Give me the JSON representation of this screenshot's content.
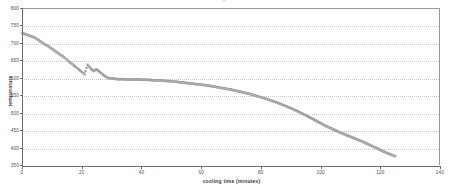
{
  "chart": {
    "title": "cooling curve",
    "plot_bg": "#ffffff",
    "grid_color": "#c9c9c9",
    "axis_color": "#6e6e6e",
    "marker_color": "#9e9e9e"
  },
  "chart_data": {
    "type": "scatter",
    "title": "cooling curve",
    "xlabel": "cooling time (minutes)",
    "ylabel": "temperature",
    "xlim": [
      0,
      140
    ],
    "ylim": [
      350,
      800
    ],
    "xticks": [
      0,
      20,
      40,
      60,
      80,
      100,
      120,
      140
    ],
    "yticks": [
      350,
      400,
      450,
      500,
      550,
      600,
      650,
      700,
      750,
      800
    ],
    "grid": true,
    "legend": false,
    "marker": "open-square",
    "series": [
      {
        "name": "cooling curve",
        "x": [
          0,
          1,
          2,
          3,
          4,
          5,
          6,
          7,
          8,
          9,
          10,
          11,
          12,
          13,
          14,
          15,
          16,
          17,
          18,
          19,
          20,
          21,
          22,
          23,
          24,
          25,
          26,
          27,
          28,
          29,
          30,
          31,
          32,
          33,
          34,
          36,
          38,
          40,
          42,
          44,
          46,
          48,
          50,
          52,
          54,
          56,
          58,
          60,
          62,
          64,
          66,
          68,
          70,
          72,
          74,
          76,
          78,
          80,
          82,
          84,
          86,
          88,
          90,
          92,
          94,
          96,
          98,
          100,
          102,
          104,
          106,
          108,
          110,
          112,
          114,
          116,
          118,
          120,
          122,
          124,
          125
        ],
        "y": [
          731,
          728,
          725,
          722,
          719,
          714,
          708,
          702,
          697,
          692,
          686,
          680,
          674,
          668,
          662,
          655,
          648,
          641,
          634,
          627,
          620,
          613,
          640,
          630,
          622,
          627,
          620,
          613,
          606,
          602,
          601,
          600,
          599,
          599,
          599,
          598,
          598,
          597,
          597,
          596,
          595,
          594,
          593,
          591,
          589,
          587,
          585,
          583,
          581,
          578,
          575,
          572,
          569,
          565,
          561,
          557,
          552,
          547,
          542,
          536,
          530,
          523,
          516,
          508,
          500,
          491,
          482,
          473,
          464,
          456,
          448,
          441,
          434,
          427,
          420,
          412,
          404,
          396,
          388,
          381,
          378
        ]
      }
    ],
    "annotations": [
      "steep initial cooling from ~730 to ~600",
      "eutectic arrest plateau near 600 between 30 and 50 minutes",
      "gradual decline then steeper drop after 90 minutes to ~378"
    ]
  },
  "axes": {
    "x_ticks": [
      "0",
      "20",
      "40",
      "60",
      "80",
      "100",
      "120",
      "140"
    ],
    "y_ticks": [
      "800",
      "750",
      "700",
      "650",
      "600",
      "550",
      "500",
      "450",
      "400",
      "350"
    ],
    "x_title": "cooling time (minutes)",
    "y_title": "temperature"
  }
}
